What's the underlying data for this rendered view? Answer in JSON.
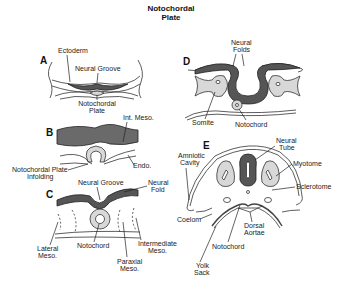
{
  "title": {
    "line1": "Notochordal",
    "line2": "Plate"
  },
  "panels": {
    "A": {
      "letter": "A",
      "labels": {
        "ectoderm": "Ectoderm",
        "neural_groove": "Neural Groove",
        "notochordal_plate_1": "Notochordal",
        "notochordal_plate_2": "Plate"
      }
    },
    "B": {
      "letter": "B",
      "labels": {
        "int_meso": "Int. Meso.",
        "endo": "Endo.",
        "infolding_1": "Notochordal Plate",
        "infolding_2": "Infolding"
      }
    },
    "C": {
      "letter": "C",
      "labels": {
        "neural_groove": "Neural Groove",
        "neural_fold_1": "Neural",
        "neural_fold_2": "Fold",
        "lateral_meso_1": "Lateral",
        "lateral_meso_2": "Meso.",
        "notochord": "Notochord",
        "paraxial_meso_1": "Paraxial",
        "paraxial_meso_2": "Meso.",
        "intermediate_meso_1": "Intermediate",
        "intermediate_meso_2": "Meso."
      }
    },
    "D": {
      "letter": "D",
      "labels": {
        "neural_folds_1": "Neural",
        "neural_folds_2": "Folds",
        "somite": "Somite",
        "notochord": "Notochord"
      }
    },
    "E": {
      "letter": "E",
      "labels": {
        "amniotic_cavity_1": "Amniotic",
        "amniotic_cavity_2": "Cavity",
        "neural_tube_1": "Neural",
        "neural_tube_2": "Tube",
        "myotome": "Myotome",
        "sclerotome": "Sclerotome",
        "coelom": "Coelom",
        "dorsal_aortae_1": "Dorsal",
        "dorsal_aortae_2": "Aortae",
        "notochord": "Notochord",
        "yolk_sack_1": "Yolk",
        "yolk_sack_2": "Sack"
      }
    }
  },
  "colors": {
    "dark_tissue": "#555555",
    "light_tissue": "#d8d8d8",
    "line": "#222222"
  }
}
